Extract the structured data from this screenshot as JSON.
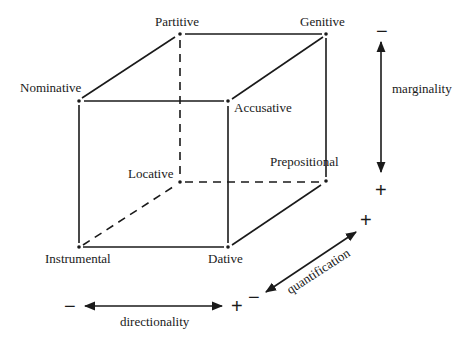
{
  "cases": {
    "partitive": "Partitive",
    "genitive": "Genitive",
    "nominative": "Nominative",
    "accusative": "Accusative",
    "locative": "Locative",
    "prepositional": "Prepositional",
    "instrumental": "Instrumental",
    "dative": "Dative"
  },
  "axes": {
    "marginality": {
      "label": "marginality",
      "minus": "−",
      "plus": "+"
    },
    "quantification": {
      "label": "quantification",
      "minus": "−",
      "plus": "+"
    },
    "directionality": {
      "label": "directionality",
      "minus": "−",
      "plus": "+"
    }
  },
  "extra_sign": "+",
  "colors": {
    "ink": "#1a1a1a",
    "background": "#ffffff"
  }
}
